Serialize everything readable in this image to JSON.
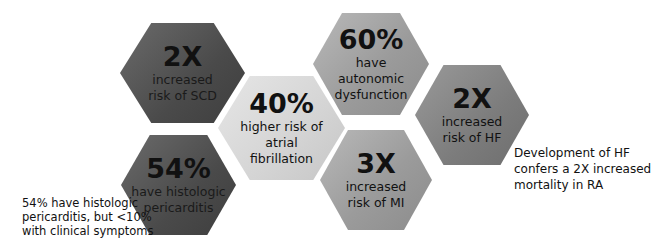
{
  "hexagons": [
    {
      "id": "scd",
      "value": "2X",
      "lines": [
        "increased",
        "risk of SCD"
      ]
    },
    {
      "id": "autonomic",
      "value": "60%",
      "lines": [
        "have",
        "autonomic",
        "dysfunction"
      ]
    },
    {
      "id": "afib",
      "value": "40%",
      "lines": [
        "higher risk of",
        "atrial",
        "fibrillation"
      ]
    },
    {
      "id": "hf",
      "value": "2X",
      "lines": [
        "increased",
        "risk of HF"
      ]
    },
    {
      "id": "pericarditis",
      "value": "54%",
      "lines": [
        "have histologic",
        "pericarditis"
      ]
    },
    {
      "id": "mi",
      "value": "3X",
      "lines": [
        "increased",
        "risk of MI"
      ]
    }
  ],
  "notes": {
    "pericarditis": [
      "54% have histologic",
      "pericarditis, but <10%",
      "with clinical symptoms"
    ],
    "hf": [
      "Development  of HF",
      "confers  a 2X increased",
      "mortality in RA"
    ]
  },
  "colors": {
    "dark": "#4a4a4a",
    "mid": "#9b9b9b",
    "light": "#d4d4d4",
    "text": "#111111"
  }
}
